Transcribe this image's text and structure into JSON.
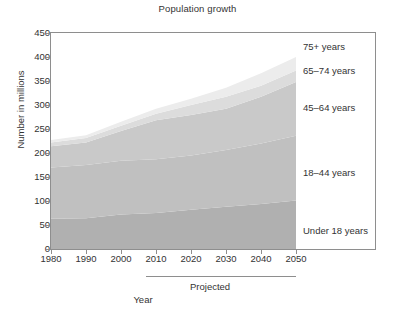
{
  "chart_data": {
    "type": "area",
    "title": "Population growth",
    "xlabel": "Year",
    "ylabel": "Number in millions",
    "xlim": [
      1980,
      2050
    ],
    "ylim": [
      0,
      450
    ],
    "grid": false,
    "legend_position": "inline-right",
    "stacked": true,
    "x": [
      1980,
      1990,
      2000,
      2010,
      2020,
      2030,
      2040,
      2050
    ],
    "x_tick_labels": [
      "1980",
      "1990",
      "2000",
      "2010",
      "2020",
      "2030",
      "2040",
      "2050"
    ],
    "y_tick_labels": [
      "0",
      "50",
      "100",
      "150",
      "200",
      "250",
      "300",
      "350",
      "400",
      "450"
    ],
    "y_ticks": [
      0,
      50,
      100,
      150,
      200,
      250,
      300,
      350,
      400,
      450
    ],
    "annotation": "Projected",
    "annotation_span": [
      2007,
      2050
    ],
    "series": [
      {
        "name": "Under 18 years",
        "color": "#b0b0b0",
        "values": [
          63,
          64,
          72,
          75,
          82,
          88,
          94,
          101
        ]
      },
      {
        "name": "18–44 years",
        "color": "#c0c0c0",
        "values": [
          107,
          111,
          112,
          112,
          113,
          118,
          126,
          135
        ]
      },
      {
        "name": "45–64 years",
        "color": "#c9c9c9",
        "values": [
          44,
          47,
          62,
          81,
          84,
          86,
          97,
          112
        ]
      },
      {
        "name": "65–74 years",
        "color": "#dcdcdc",
        "values": [
          8,
          9,
          11,
          14,
          21,
          25,
          23,
          24
        ]
      },
      {
        "name": "75+ years",
        "color": "#ececec",
        "values": [
          5,
          6,
          8,
          10,
          13,
          19,
          26,
          28
        ]
      }
    ],
    "cumulative_totals": [
      227,
      237,
      265,
      292,
      313,
      336,
      366,
      400
    ],
    "series_label_positions": [
      {
        "name": "75+ years",
        "top": 42,
        "left": 303
      },
      {
        "name": "65–74 years",
        "top": 66,
        "left": 303
      },
      {
        "name": "45–64 years",
        "top": 103,
        "left": 303
      },
      {
        "name": "18–44 years",
        "top": 168,
        "left": 303
      },
      {
        "name": "Under 18 years",
        "top": 226,
        "left": 303
      }
    ]
  }
}
